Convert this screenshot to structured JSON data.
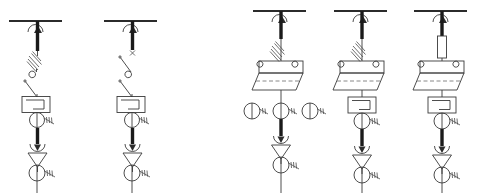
{
  "diagram": {
    "type": "electrical-single-line",
    "background_color": "#ffffff",
    "line_color": "#3a3a3a",
    "bus_color": "#2b2b2b",
    "accent_color": "#1a1a1a",
    "width": 480,
    "height": 196,
    "panel_count": 5,
    "group_labels": [
      "Group A (fixed-type panels)",
      "Group B (withdrawable-type panels)"
    ],
    "panels": [
      {
        "id": "panel-1",
        "name": "fixed-panel-1",
        "center_x": 35,
        "bus_x1": 9,
        "bus_x2": 62,
        "bus_y": 21,
        "components": [
          {
            "name": "busbar",
            "symbol": "bus-bar",
            "y": 21
          },
          {
            "name": "isolator-arrow",
            "symbol": "up-arrow-riser",
            "y": 30
          },
          {
            "name": "riser-bar",
            "symbol": "thick-vertical-bar",
            "y": 33,
            "y2": 50
          },
          {
            "name": "fuse",
            "symbol": "hatched-fuse-diagonal",
            "y": 58
          },
          {
            "name": "disconnect-switch",
            "symbol": "open-blade-switch",
            "y": 72
          },
          {
            "name": "circuit-breaker",
            "symbol": "square-breaker-box",
            "y": 103
          },
          {
            "name": "current-transformer",
            "symbol": "ct-circle-coil",
            "y": 119
          },
          {
            "name": "cable-riser",
            "symbol": "thick-vertical-bar",
            "y": 130,
            "y2": 144
          },
          {
            "name": "earthing-arrow",
            "symbol": "down-arrow-hook",
            "y": 147
          },
          {
            "name": "surge-arrester",
            "symbol": "triangle-down",
            "y": 156
          },
          {
            "name": "current-transformer-2",
            "symbol": "ct-circle-coil",
            "y": 172
          },
          {
            "name": "feeder-outgoing",
            "symbol": "vertical-line",
            "y": 181,
            "y2": 193
          }
        ]
      },
      {
        "id": "panel-2",
        "name": "fixed-panel-2",
        "center_x": 130,
        "bus_x1": 104,
        "bus_x2": 157,
        "bus_y": 21,
        "components": [
          {
            "name": "busbar",
            "symbol": "bus-bar",
            "y": 21
          },
          {
            "name": "isolator-arrow",
            "symbol": "up-arrow-riser",
            "y": 30
          },
          {
            "name": "riser-bar",
            "symbol": "thick-vertical-bar",
            "y": 33,
            "y2": 50
          },
          {
            "name": "fault-marker",
            "symbol": "x-cross-mark",
            "y": 53
          },
          {
            "name": "disconnect-switch",
            "symbol": "open-blade-switch",
            "y": 62
          },
          {
            "name": "disconnect-switch-2",
            "symbol": "open-blade-switch",
            "y": 80
          },
          {
            "name": "circuit-breaker",
            "symbol": "square-breaker-box",
            "y": 103
          },
          {
            "name": "current-transformer",
            "symbol": "ct-circle-coil",
            "y": 119
          },
          {
            "name": "cable-riser",
            "symbol": "thick-vertical-bar",
            "y": 130,
            "y2": 144
          },
          {
            "name": "earthing-arrow",
            "symbol": "down-arrow-hook",
            "y": 147
          },
          {
            "name": "surge-arrester",
            "symbol": "triangle-down",
            "y": 156
          },
          {
            "name": "current-transformer-2",
            "symbol": "ct-circle-coil",
            "y": 172
          },
          {
            "name": "feeder-outgoing",
            "symbol": "vertical-line",
            "y": 181,
            "y2": 193
          }
        ]
      },
      {
        "id": "panel-3",
        "name": "withdrawable-panel-1",
        "center_x": 279,
        "bus_x1": 253,
        "bus_x2": 306,
        "bus_y": 11,
        "components": [
          {
            "name": "busbar",
            "symbol": "bus-bar",
            "y": 11
          },
          {
            "name": "isolator-arrow",
            "symbol": "up-arrow-riser",
            "y": 20
          },
          {
            "name": "riser-bar",
            "symbol": "thick-vertical-bar",
            "y": 22,
            "y2": 38
          },
          {
            "name": "fuse",
            "symbol": "hatched-fuse-diagonal",
            "y": 48
          },
          {
            "name": "withdrawable-truck",
            "symbol": "parallelogram-truck",
            "y": 72
          },
          {
            "name": "current-transformer-left",
            "symbol": "ct-circle-coil",
            "y": 110
          },
          {
            "name": "current-transformer-center",
            "symbol": "ct-circle-coil",
            "y": 110
          },
          {
            "name": "current-transformer-right",
            "symbol": "ct-circle-coil",
            "y": 110
          },
          {
            "name": "cable-riser",
            "symbol": "thick-vertical-bar",
            "y": 122,
            "y2": 136
          },
          {
            "name": "earthing-arrow",
            "symbol": "down-arrow-hook",
            "y": 139
          },
          {
            "name": "surge-arrester",
            "symbol": "triangle-down",
            "y": 148
          },
          {
            "name": "current-transformer-2",
            "symbol": "ct-circle-coil",
            "y": 164
          },
          {
            "name": "feeder-outgoing",
            "symbol": "vertical-line",
            "y": 173,
            "y2": 193
          }
        ]
      },
      {
        "id": "panel-4",
        "name": "withdrawable-panel-2",
        "center_x": 360,
        "bus_x1": 334,
        "bus_x2": 387,
        "bus_y": 11,
        "components": [
          {
            "name": "busbar",
            "symbol": "bus-bar",
            "y": 11
          },
          {
            "name": "isolator-arrow",
            "symbol": "up-arrow-riser",
            "y": 20
          },
          {
            "name": "riser-bar",
            "symbol": "thick-vertical-bar",
            "y": 22,
            "y2": 38
          },
          {
            "name": "fuse",
            "symbol": "hatched-fuse-diagonal",
            "y": 48
          },
          {
            "name": "withdrawable-truck",
            "symbol": "parallelogram-truck",
            "y": 72
          },
          {
            "name": "circuit-breaker",
            "symbol": "square-breaker-box",
            "y": 104
          },
          {
            "name": "current-transformer",
            "symbol": "ct-circle-coil",
            "y": 122
          },
          {
            "name": "cable-riser",
            "symbol": "thick-vertical-bar",
            "y": 133,
            "y2": 146
          },
          {
            "name": "earthing-arrow",
            "symbol": "down-arrow-hook",
            "y": 149
          },
          {
            "name": "surge-arrester",
            "symbol": "triangle-down",
            "y": 158
          },
          {
            "name": "current-transformer-2",
            "symbol": "ct-circle-coil",
            "y": 174
          },
          {
            "name": "feeder-outgoing",
            "symbol": "vertical-line",
            "y": 183,
            "y2": 193
          }
        ]
      },
      {
        "id": "panel-5",
        "name": "withdrawable-panel-3",
        "center_x": 440,
        "bus_x1": 414,
        "bus_x2": 467,
        "bus_y": 11,
        "components": [
          {
            "name": "busbar",
            "symbol": "bus-bar",
            "y": 11
          },
          {
            "name": "isolator-arrow",
            "symbol": "up-arrow-riser",
            "y": 20
          },
          {
            "name": "riser-bar",
            "symbol": "thick-vertical-bar",
            "y": 22,
            "y2": 34
          },
          {
            "name": "fuse-cartridge",
            "symbol": "rectangle-fuse-vertical",
            "y": 48
          },
          {
            "name": "withdrawable-truck",
            "symbol": "parallelogram-truck",
            "y": 72
          },
          {
            "name": "circuit-breaker",
            "symbol": "square-breaker-box",
            "y": 104
          },
          {
            "name": "current-transformer",
            "symbol": "ct-circle-coil",
            "y": 122
          },
          {
            "name": "cable-riser",
            "symbol": "thick-vertical-bar",
            "y": 133,
            "y2": 146
          },
          {
            "name": "earthing-arrow",
            "symbol": "down-arrow-hook",
            "y": 149
          },
          {
            "name": "surge-arrester",
            "symbol": "triangle-down",
            "y": 158
          },
          {
            "name": "current-transformer-2",
            "symbol": "ct-circle-coil",
            "y": 174
          },
          {
            "name": "feeder-outgoing",
            "symbol": "vertical-line",
            "y": 183,
            "y2": 193
          }
        ]
      }
    ]
  }
}
